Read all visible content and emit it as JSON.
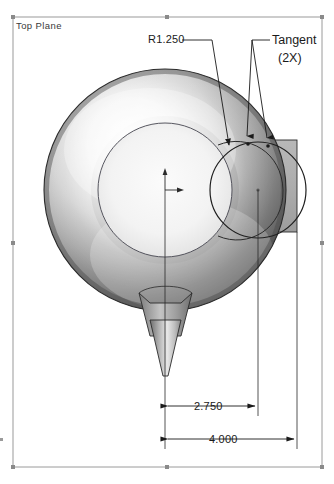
{
  "view": {
    "background_color": "#ffffff",
    "width": 334,
    "height": 484
  },
  "plane": {
    "label": "Top Plane",
    "border_color": "#9a9a9a",
    "handle_color": "#8a8a8a",
    "bounds": {
      "x1": 13,
      "y1": 17,
      "x2": 322,
      "y2": 467
    }
  },
  "annotations": [
    {
      "name": "radius-callout",
      "text": "R1.250",
      "type": "radius",
      "value": 1.25,
      "leader_color": "#1a1a1a"
    },
    {
      "name": "tangent-callout",
      "text_line_1": "Tangent",
      "text_line_2": "(2X)",
      "type": "relation",
      "quantity": 2,
      "leader_color": "#1a1a1a"
    }
  ],
  "dimensions": [
    {
      "name": "dim-2750",
      "text": "2.750",
      "value": 2.75,
      "from_x": 165,
      "to_x": 258,
      "line_y": 406
    },
    {
      "name": "dim-4000",
      "text": "4.000",
      "value": 4.0,
      "from_x": 165,
      "to_x": 297,
      "line_y": 439
    }
  ],
  "geometry": {
    "body_color_light": "#fdfdfd",
    "body_color_mid": "#b4b4b4",
    "body_color_dark": "#4e4e4e",
    "outline_color": "#222222",
    "sketch_color": "#3c3c3c",
    "block_fill": "#aeaeae",
    "torus": {
      "cx": 165,
      "cy": 190,
      "r_outer": 121,
      "r_inner": 66
    },
    "tangent_circle": {
      "cx": 258,
      "cy": 190,
      "r": 48
    },
    "block": {
      "x1": 231,
      "y1": 140,
      "x2": 297,
      "y2": 232
    },
    "cone": {
      "cx": 165,
      "top_y": 293,
      "tip_y": 376,
      "half_width": 26
    },
    "origin": {
      "x": 165,
      "y": 190
    }
  }
}
